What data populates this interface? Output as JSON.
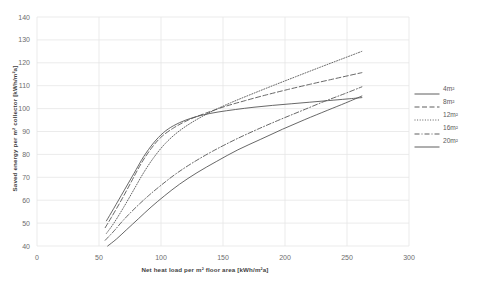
{
  "chart_data": {
    "type": "line",
    "title": "",
    "xlabel": "Net heat load per m² floor area [kWh/m²a]",
    "ylabel": "Saved energy per m² collector [kWh/m²a]",
    "xlim": [
      0,
      300
    ],
    "ylim": [
      40,
      140
    ],
    "xticks": [
      "0",
      "50",
      "100",
      "150",
      "200",
      "250",
      "300"
    ],
    "xtick_values": [
      0,
      50,
      100,
      150,
      200,
      250,
      300
    ],
    "yticks": [
      "40",
      "50",
      "60",
      "70",
      "80",
      "90",
      "100",
      "110",
      "120",
      "130",
      "140"
    ],
    "ytick_values": [
      40,
      50,
      60,
      70,
      80,
      90,
      100,
      110,
      120,
      130,
      140
    ],
    "grid": true,
    "grid_color": "#e6e6e6",
    "legend_position": "right",
    "line_color": "#4d4d4d",
    "series": [
      {
        "name": "4m²",
        "style": "solid",
        "x": [
          56,
          62,
          70,
          78,
          86,
          94,
          102,
          110,
          120,
          132,
          146,
          160,
          175,
          190,
          205,
          220,
          235,
          250,
          262
        ],
        "values": [
          51.0,
          56.5,
          64.0,
          71.5,
          79.0,
          85.0,
          89.5,
          92.5,
          95.0,
          97.0,
          98.5,
          99.6,
          100.6,
          101.4,
          102.1,
          102.8,
          103.5,
          104.2,
          104.8
        ]
      },
      {
        "name": "8m²",
        "style": "dashed",
        "x": [
          55,
          60,
          68,
          76,
          84,
          92,
          100,
          110,
          122,
          136,
          152,
          168,
          185,
          202,
          220,
          238,
          252,
          262
        ],
        "values": [
          48.0,
          52.5,
          60.0,
          68.0,
          76.0,
          82.5,
          87.5,
          91.5,
          95.0,
          98.0,
          101.0,
          103.5,
          106.0,
          108.3,
          110.6,
          112.8,
          114.5,
          115.7
        ]
      },
      {
        "name": "12m²",
        "style": "dotted",
        "x": [
          56,
          62,
          70,
          78,
          86,
          94,
          103,
          113,
          125,
          140,
          156,
          173,
          191,
          209,
          228,
          245,
          262
        ],
        "values": [
          45.5,
          50.0,
          57.0,
          64.5,
          72.0,
          78.5,
          84.5,
          89.5,
          94.0,
          98.5,
          102.5,
          106.3,
          110.2,
          114.0,
          118.0,
          121.5,
          125.0
        ]
      },
      {
        "name": "16m²",
        "style": "dashdot",
        "x": [
          55,
          62,
          70,
          80,
          90,
          100,
          112,
          126,
          142,
          160,
          178,
          196,
          214,
          232,
          248,
          262
        ],
        "values": [
          42.5,
          46.5,
          51.5,
          57.0,
          62.0,
          66.5,
          71.5,
          76.5,
          81.5,
          86.5,
          91.0,
          95.2,
          99.2,
          103.2,
          106.5,
          109.5
        ]
      },
      {
        "name": "20m²",
        "style": "solid",
        "x": [
          57,
          64,
          72,
          82,
          92,
          103,
          115,
          129,
          145,
          162,
          180,
          198,
          216,
          234,
          249,
          262
        ],
        "values": [
          40.0,
          43.0,
          47.0,
          52.0,
          57.0,
          62.0,
          67.0,
          72.0,
          77.0,
          82.0,
          86.5,
          91.0,
          95.2,
          99.2,
          102.5,
          105.5
        ]
      }
    ]
  },
  "legend": {
    "items": [
      {
        "label": "4m²",
        "style": "solid"
      },
      {
        "label": "8m²",
        "style": "dashed"
      },
      {
        "label": "12m²",
        "style": "dotted"
      },
      {
        "label": "16m²",
        "style": "dashdot"
      },
      {
        "label": "20m²",
        "style": "solid"
      }
    ]
  }
}
